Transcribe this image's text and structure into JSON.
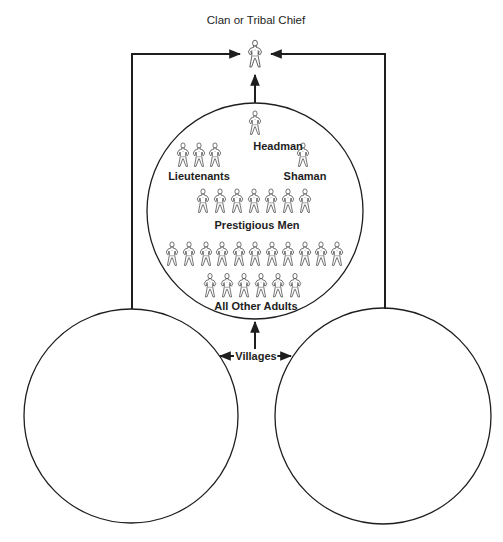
{
  "diagram": {
    "title": "Clan or Tribal Chief",
    "colors": {
      "stroke": "#1e1e1e",
      "background": "#ffffff",
      "figure_fill": "#ffffff"
    },
    "top_node": {
      "label": "Clan or Tribal Chief",
      "figures": 1
    },
    "village_circle": {
      "tiers": [
        {
          "id": "headman",
          "label": "Headman",
          "figures": 1
        },
        {
          "id": "lieutenants",
          "label": "Lieutenants",
          "figures": 3
        },
        {
          "id": "shaman",
          "label": "Shaman",
          "figures": 1
        },
        {
          "id": "prestigious-men",
          "label": "Prestigious Men",
          "figures": 7
        },
        {
          "id": "all-other-adults",
          "label": "All Other Adults",
          "figures": 17,
          "rows": [
            11,
            6
          ]
        }
      ]
    },
    "villages_label": "Villages",
    "village_count": 3,
    "connections": [
      "Left village → Clan or Tribal Chief",
      "Right village → Clan or Tribal Chief",
      "Center village → Clan or Tribal Chief",
      "Villages ↔ left, center, right village"
    ]
  }
}
